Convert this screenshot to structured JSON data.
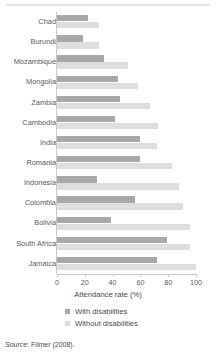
{
  "chart_data": {
    "type": "bar",
    "orientation": "horizontal",
    "title": "",
    "xlabel": "Attendance rate (%)",
    "ylabel": "",
    "xlim": [
      0,
      100
    ],
    "xticks": [
      0,
      20,
      40,
      60,
      80,
      100
    ],
    "grid": false,
    "legend_position": "bottom",
    "categories": [
      "Chad",
      "Burundi",
      "Mozambique",
      "Mongolia",
      "Zambia",
      "Cambodia",
      "India",
      "Romania",
      "Indonesia",
      "Colombia",
      "Bolivia",
      "South Africa",
      "Jamaica"
    ],
    "series": [
      {
        "name": "With disabilities",
        "color": "#a8a8a8",
        "values": [
          22,
          19,
          34,
          44,
          45,
          42,
          60,
          60,
          29,
          56,
          39,
          79,
          72
        ]
      },
      {
        "name": "Without disabilities",
        "color": "#dedede",
        "values": [
          30,
          30,
          51,
          58,
          67,
          73,
          72,
          83,
          88,
          91,
          96,
          96,
          100
        ]
      }
    ]
  },
  "axis": {
    "x_title": "Attendance rate (%)",
    "tick_labels": [
      "0",
      "20",
      "40",
      "60",
      "80",
      "100"
    ]
  },
  "legend": {
    "items": [
      {
        "label": "With disabilities",
        "color": "#a8a8a8"
      },
      {
        "label": "Without disabilities",
        "color": "#dedede"
      }
    ]
  },
  "source": {
    "prefix": "Source:",
    "text": "Filmer (2008)."
  }
}
